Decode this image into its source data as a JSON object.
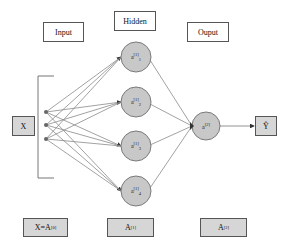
{
  "diagram": {
    "type": "neural-network",
    "headers": {
      "input": "Input",
      "hidden": "Hidden",
      "output": "Ouput"
    },
    "input_box": {
      "label": "X"
    },
    "input_nodes": 3,
    "hidden_nodes": [
      {
        "base": "a",
        "sup": "[1]",
        "sub": "1"
      },
      {
        "base": "a",
        "sup": "[1]",
        "sub": "2"
      },
      {
        "base": "a",
        "sup": "[1]",
        "sub": "3"
      },
      {
        "base": "a",
        "sup": "[1]",
        "sub": "4"
      }
    ],
    "output_node": {
      "base": "a",
      "sup": "[2]"
    },
    "output_box": {
      "label": "Ŷ"
    },
    "bottom_labels": [
      {
        "base": "X=A",
        "sup": "[0]"
      },
      {
        "base": "A",
        "sup": "[1]"
      },
      {
        "base": "A",
        "sup": "[2]"
      }
    ],
    "colors": {
      "node_fill": "#c8c8c8",
      "node_stroke": "#7a7a7a",
      "edge": "#8a8a8a",
      "box_fill_grey": "#d6d6d6",
      "arrow": "#333333"
    }
  }
}
